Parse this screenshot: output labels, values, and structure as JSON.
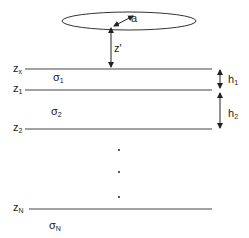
{
  "diagram": {
    "coil": {
      "radius_label": "a",
      "height_label": "z'"
    },
    "interfaces": [
      {
        "label": "z",
        "sub": "x",
        "y": 69
      },
      {
        "label": "z",
        "sub": "1",
        "y": 90
      },
      {
        "label": "z",
        "sub": "2",
        "y": 129
      },
      {
        "label": "z",
        "sub": "N",
        "y": 209
      }
    ],
    "layers": [
      {
        "label": "σ",
        "sub": "1"
      },
      {
        "label": "σ",
        "sub": "2"
      },
      {
        "label": "σ",
        "sub": "N"
      }
    ],
    "thicknesses": [
      {
        "label": "h",
        "sub": "1"
      },
      {
        "label": "h",
        "sub": "2"
      }
    ],
    "ellipsis": "⋮",
    "colors": {
      "line": "#333333",
      "background": "#ffffff"
    }
  }
}
